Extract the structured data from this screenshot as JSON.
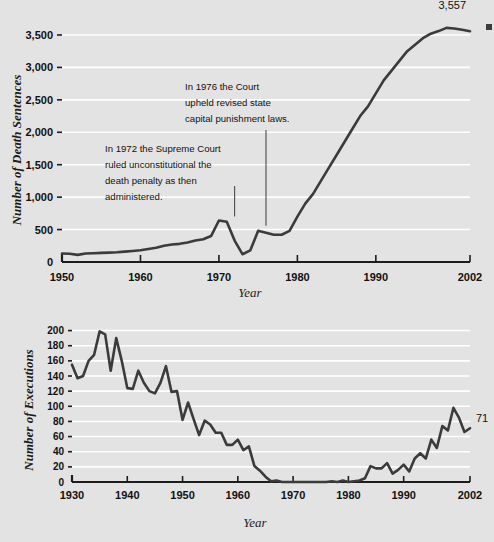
{
  "figure": {
    "background_color": "#eeeeee",
    "plot_background_color": "#e3e3e3",
    "gridline_color": "#ffffff",
    "series_color": "#3b3b3b",
    "axis_color": "#1d1d1d"
  },
  "corner_mark": {
    "name": "crop-mark",
    "color": "#3c3c3c"
  },
  "chart_data": [
    {
      "id": "death-sentences",
      "type": "line",
      "title": "",
      "xlabel": "Year",
      "ylabel": "Number of Death Sentences",
      "xlim": [
        1950,
        2002
      ],
      "ylim": [
        0,
        3700
      ],
      "grid": true,
      "legend": "none",
      "xticks": [
        1950,
        1960,
        1970,
        1980,
        1990,
        2002
      ],
      "xtick_labels": [
        "1950",
        "1960",
        "1970",
        "1980",
        "1990",
        "2002"
      ],
      "yticks": [
        0,
        500,
        1000,
        1500,
        2000,
        2500,
        3000,
        3500
      ],
      "ytick_labels": [
        "0",
        "500",
        "1,000",
        "1,500",
        "2,000",
        "2,500",
        "3,000",
        "3,500"
      ],
      "end_label": "3,557",
      "annotations": [
        {
          "id": "annot-1972",
          "lines": [
            "In 1972 the Supreme Court",
            "ruled unconstitutional the",
            "death penalty as then",
            "administered."
          ],
          "points_to_year": 1972
        },
        {
          "id": "annot-1976",
          "lines": [
            "In 1976 the Court",
            "upheld revised state",
            "capital punishment laws."
          ],
          "points_to_year": 1976
        }
      ],
      "x": [
        1950,
        1951,
        1952,
        1953,
        1954,
        1955,
        1956,
        1957,
        1958,
        1959,
        1960,
        1961,
        1962,
        1963,
        1964,
        1965,
        1966,
        1967,
        1968,
        1969,
        1970,
        1971,
        1972,
        1973,
        1974,
        1975,
        1976,
        1977,
        1978,
        1979,
        1980,
        1981,
        1982,
        1983,
        1984,
        1985,
        1986,
        1987,
        1988,
        1989,
        1990,
        1991,
        1992,
        1993,
        1994,
        1995,
        1996,
        1997,
        1998,
        1999,
        2000,
        2001,
        2002
      ],
      "values": [
        130,
        128,
        110,
        130,
        135,
        140,
        145,
        150,
        160,
        170,
        180,
        200,
        220,
        250,
        270,
        280,
        300,
        330,
        350,
        400,
        640,
        620,
        330,
        120,
        180,
        480,
        450,
        420,
        420,
        480,
        700,
        900,
        1050,
        1250,
        1450,
        1650,
        1850,
        2050,
        2250,
        2400,
        2600,
        2800,
        2950,
        3100,
        3250,
        3350,
        3450,
        3520,
        3560,
        3610,
        3600,
        3580,
        3557
      ]
    },
    {
      "id": "executions",
      "type": "line",
      "title": "",
      "xlabel": "Year",
      "ylabel": "Number of Executions",
      "xlim": [
        1930,
        2002
      ],
      "ylim": [
        0,
        210
      ],
      "grid": true,
      "legend": "none",
      "xticks": [
        1930,
        1940,
        1950,
        1960,
        1970,
        1980,
        1990,
        2002
      ],
      "xtick_labels": [
        "1930",
        "1940",
        "1950",
        "1960",
        "1970",
        "1980",
        "1990",
        "2002"
      ],
      "yticks": [
        0,
        20,
        40,
        60,
        80,
        100,
        120,
        140,
        160,
        180,
        200
      ],
      "ytick_labels": [
        "0",
        "20",
        "40",
        "60",
        "80",
        "100",
        "120",
        "140",
        "160",
        "180",
        "200"
      ],
      "end_label": "71",
      "annotations": [],
      "x": [
        1930,
        1931,
        1932,
        1933,
        1934,
        1935,
        1936,
        1937,
        1938,
        1939,
        1940,
        1941,
        1942,
        1943,
        1944,
        1945,
        1946,
        1947,
        1948,
        1949,
        1950,
        1951,
        1952,
        1953,
        1954,
        1955,
        1956,
        1957,
        1958,
        1959,
        1960,
        1961,
        1962,
        1963,
        1964,
        1965,
        1966,
        1967,
        1968,
        1969,
        1970,
        1971,
        1972,
        1973,
        1974,
        1975,
        1976,
        1977,
        1978,
        1979,
        1980,
        1981,
        1982,
        1983,
        1984,
        1985,
        1986,
        1987,
        1988,
        1989,
        1990,
        1991,
        1992,
        1993,
        1994,
        1995,
        1996,
        1997,
        1998,
        1999,
        2000,
        2001,
        2002
      ],
      "values": [
        155,
        137,
        140,
        160,
        168,
        199,
        195,
        147,
        190,
        160,
        124,
        123,
        147,
        131,
        120,
        117,
        131,
        153,
        119,
        120,
        82,
        105,
        83,
        62,
        81,
        76,
        65,
        65,
        49,
        49,
        56,
        42,
        47,
        21,
        15,
        7,
        1,
        2,
        0,
        0,
        0,
        0,
        0,
        0,
        0,
        0,
        0,
        1,
        0,
        2,
        0,
        1,
        2,
        5,
        21,
        18,
        18,
        25,
        11,
        16,
        23,
        14,
        31,
        38,
        31,
        56,
        45,
        74,
        68,
        98,
        85,
        66,
        71
      ]
    }
  ]
}
